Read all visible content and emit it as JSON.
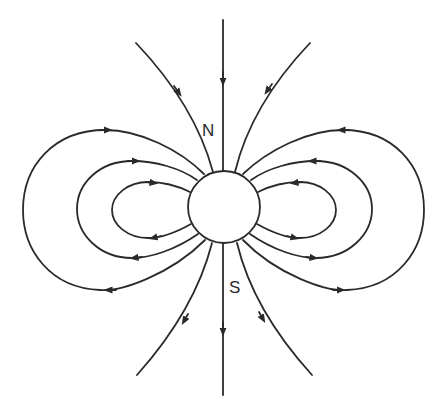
{
  "diagram": {
    "labels": {
      "north": "N",
      "south": "S"
    },
    "line_color": "#2a2a2a",
    "background": "#ffffff",
    "elements": {
      "central_body": "circle",
      "field_lines": [
        {
          "name": "axial-line-top",
          "direction": "toward body"
        },
        {
          "name": "axial-line-bottom",
          "direction": "away from body"
        },
        {
          "name": "top-left-line",
          "direction": "toward body"
        },
        {
          "name": "top-right-line",
          "direction": "toward body"
        },
        {
          "name": "bottom-left-line",
          "direction": "away from body"
        },
        {
          "name": "bottom-right-line",
          "direction": "away from body"
        },
        {
          "name": "left-loop-inner",
          "direction": "clockwise"
        },
        {
          "name": "left-loop-middle",
          "direction": "clockwise"
        },
        {
          "name": "left-loop-outer",
          "direction": "clockwise"
        },
        {
          "name": "right-loop-inner",
          "direction": "counterclockwise"
        },
        {
          "name": "right-loop-middle",
          "direction": "counterclockwise"
        },
        {
          "name": "right-loop-outer",
          "direction": "counterclockwise"
        }
      ]
    }
  }
}
